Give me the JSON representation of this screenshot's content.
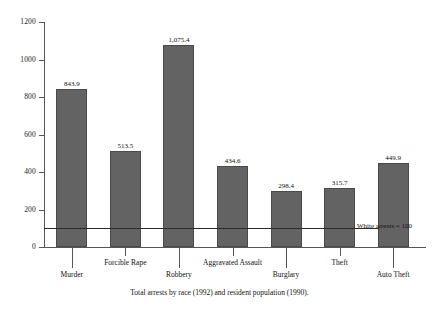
{
  "chart_data": {
    "type": "bar",
    "title": "",
    "subtitle": "",
    "caption": "Total arrests by race (1992) and resident population (1990).",
    "categories": [
      "Murder",
      "Forcible Rape",
      "Robbery",
      "Aggravated Assault",
      "Burglary",
      "Theft",
      "Auto Theft"
    ],
    "values": [
      843.9,
      513.5,
      1075.4,
      434.6,
      298.4,
      315.7,
      449.9
    ],
    "value_labels": [
      "843.9",
      "513.5",
      "1,075.4",
      "434.6",
      "298.4",
      "315.7",
      "449.9"
    ],
    "xlabel": "",
    "ylabel": "",
    "ylim": [
      0,
      1200
    ],
    "ytick_values": [
      0,
      200,
      400,
      600,
      800,
      1000,
      1200
    ],
    "ytick_labels": [
      "0",
      "200",
      "400",
      "600",
      "800",
      "1000",
      "1200"
    ],
    "grid": false,
    "legend": null,
    "bar_color": "#636363",
    "reference_line": {
      "value": 100,
      "label": "White arrests = 100",
      "color": "#2b2b2b"
    },
    "label_rows": [
      1,
      0,
      1,
      0,
      1,
      0,
      1
    ]
  }
}
